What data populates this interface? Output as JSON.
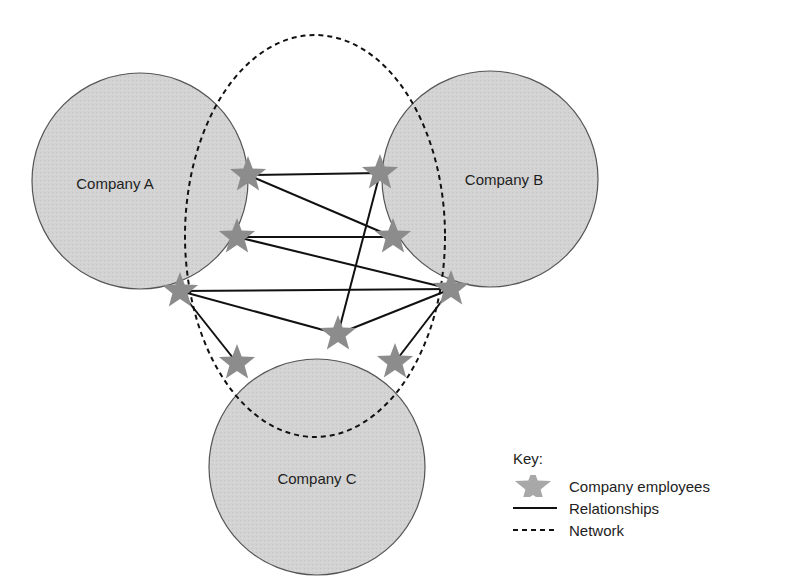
{
  "colors": {
    "circle_fill": "#d2d2d2",
    "circle_stroke": "#555555",
    "star_fill": "#8c8c8c",
    "line": "#111111",
    "network": "#111111"
  },
  "companies": [
    {
      "id": "A",
      "label": "Company A",
      "cx": 140,
      "cy": 181,
      "r": 108,
      "label_x": 115,
      "label_y": 189
    },
    {
      "id": "B",
      "label": "Company B",
      "cx": 490,
      "cy": 179,
      "r": 108,
      "label_x": 504,
      "label_y": 185
    },
    {
      "id": "C",
      "label": "Company C",
      "cx": 317,
      "cy": 467,
      "r": 108,
      "label_x": 317,
      "label_y": 484
    }
  ],
  "network": {
    "cx": 315,
    "cy": 236,
    "rx": 130,
    "ry": 201
  },
  "employees": [
    {
      "id": "S1",
      "x": 248,
      "y": 175
    },
    {
      "id": "S2",
      "x": 380,
      "y": 173
    },
    {
      "id": "S3",
      "x": 237,
      "y": 237
    },
    {
      "id": "S4",
      "x": 393,
      "y": 237
    },
    {
      "id": "S5",
      "x": 180,
      "y": 291
    },
    {
      "id": "S6",
      "x": 451,
      "y": 289
    },
    {
      "id": "S7",
      "x": 338,
      "y": 334
    },
    {
      "id": "S8",
      "x": 237,
      "y": 363
    },
    {
      "id": "S9",
      "x": 395,
      "y": 362
    }
  ],
  "relationships": [
    [
      "S1",
      "S2"
    ],
    [
      "S1",
      "S4"
    ],
    [
      "S3",
      "S4"
    ],
    [
      "S3",
      "S6"
    ],
    [
      "S5",
      "S6"
    ],
    [
      "S5",
      "S7"
    ],
    [
      "S5",
      "S8"
    ],
    [
      "S6",
      "S7"
    ],
    [
      "S6",
      "S9"
    ],
    [
      "S7",
      "S2"
    ]
  ],
  "legend": {
    "title": "Key:",
    "items": [
      {
        "symbol": "star-icon",
        "label": "Company employees"
      },
      {
        "symbol": "solid-line",
        "label": "Relationships"
      },
      {
        "symbol": "dashed-line",
        "label": "Network"
      }
    ]
  }
}
